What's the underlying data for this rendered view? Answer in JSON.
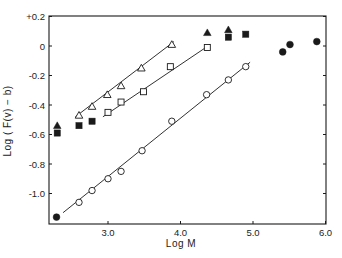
{
  "chart_data": {
    "type": "scatter",
    "title": "",
    "xlabel": "Log M",
    "ylabel": "Log ( F(v) − b)",
    "xlim": [
      2.2,
      6.0
    ],
    "ylim": [
      -1.2,
      0.2
    ],
    "grid": false,
    "legend": "none",
    "x_ticks": [
      3.0,
      4.0,
      5.0,
      6.0
    ],
    "x_tick_labels": [
      "3.0",
      "4.0",
      "5.0",
      "6.0"
    ],
    "y_ticks": [
      0.2,
      0.0,
      -0.2,
      -0.4,
      -0.6,
      -0.8,
      -1.0
    ],
    "y_tick_labels": [
      "+0.2",
      "0",
      "-0.2",
      "-0.4",
      "-0.6",
      "-0.8",
      "-1.0"
    ],
    "series": [
      {
        "name": "open-triangles",
        "marker": "triangle-open",
        "x": [
          2.6,
          2.78,
          2.99,
          3.18,
          3.46,
          3.88
        ],
        "y": [
          -0.47,
          -0.41,
          -0.33,
          -0.27,
          -0.15,
          0.01
        ],
        "fit_line": {
          "x": [
            2.55,
            3.91
          ],
          "y": [
            -0.48,
            0.03
          ]
        }
      },
      {
        "name": "open-squares",
        "marker": "square-open",
        "x": [
          3.0,
          3.18,
          3.49,
          3.86,
          4.37
        ],
        "y": [
          -0.45,
          -0.38,
          -0.31,
          -0.14,
          -0.01
        ],
        "fit_line": {
          "x": [
            2.93,
            4.41
          ],
          "y": [
            -0.48,
            0.01
          ]
        }
      },
      {
        "name": "open-circles",
        "marker": "circle-open",
        "x": [
          2.6,
          2.78,
          3.0,
          3.18,
          3.47,
          3.88,
          4.36,
          4.66,
          4.9
        ],
        "y": [
          -1.06,
          -0.98,
          -0.9,
          -0.85,
          -0.71,
          -0.51,
          -0.33,
          -0.23,
          -0.14
        ],
        "fit_line": {
          "x": [
            2.38,
            4.96
          ],
          "y": [
            -1.13,
            -0.11
          ]
        }
      },
      {
        "name": "filled-triangles",
        "marker": "triangle-filled",
        "x": [
          2.3,
          4.37,
          4.66
        ],
        "y": [
          -0.54,
          0.09,
          0.11
        ]
      },
      {
        "name": "filled-squares",
        "marker": "square-filled",
        "x": [
          2.3,
          2.6,
          2.78,
          4.66,
          4.9
        ],
        "y": [
          -0.59,
          -0.54,
          -0.51,
          0.06,
          0.08
        ]
      },
      {
        "name": "filled-circles",
        "marker": "circle-filled",
        "x": [
          2.29,
          5.41,
          5.51,
          5.88
        ],
        "y": [
          -1.16,
          -0.04,
          0.01,
          0.03
        ]
      }
    ]
  },
  "layout": {
    "plot": {
      "left": 49,
      "right": 326,
      "top": 16,
      "bottom": 224
    },
    "x_ref": {
      "value": 3.0,
      "px": 108,
      "px_per_unit": 72.5
    },
    "y_ref": {
      "value": 0.0,
      "px": 46,
      "px_per_unit": 147.5
    },
    "ink_color": "#1a1a1a"
  }
}
